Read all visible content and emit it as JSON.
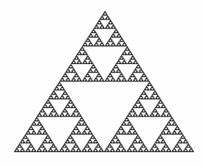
{
  "figure": {
    "background_color": "#fefefe",
    "fill_color": "#2a2a2a",
    "vertices": {
      "top": [
        105,
        11
      ],
      "bottom_left": [
        14,
        152
      ],
      "bottom_right": [
        194,
        152
      ]
    },
    "depth": 6
  }
}
